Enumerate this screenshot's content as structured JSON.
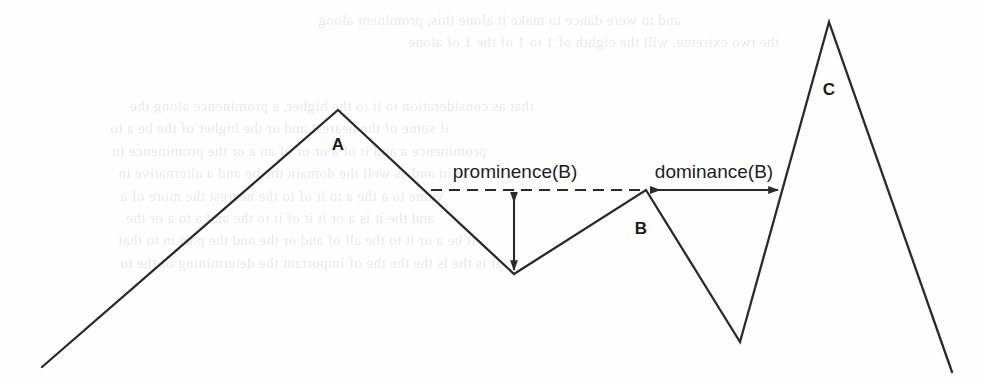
{
  "figure": {
    "background_color": "#fefefe",
    "line_color": "#2a2a2a",
    "ghost_text_color": "#b9b9b9"
  },
  "peaks": [
    {
      "id": "A",
      "label": "A",
      "label_x": 338,
      "label_y": 150
    },
    {
      "id": "B",
      "label": "B",
      "label_x": 641,
      "label_y": 234
    },
    {
      "id": "C",
      "label": "C",
      "label_x": 829,
      "label_y": 95
    }
  ],
  "annotations": {
    "prominence": {
      "label": "prominence(B)",
      "label_x": 515,
      "label_y": 178
    },
    "dominance": {
      "label": "dominance(B)",
      "label_x": 714,
      "label_y": 178
    }
  },
  "ghost_text": {
    "note": "faint mirrored show-through text from reverse of scanned page",
    "lines": [
      {
        "text": "and to were dance to make it alone this, prominent along",
        "x": 318,
        "y": 12,
        "size": 15
      },
      {
        "text": "the two extreme, will the eighth of 1 to 1 of the 1 of alone",
        "x": 408,
        "y": 34,
        "size": 15
      },
      {
        "text": "that as consideration to it to the higher, a prominence along the",
        "x": 130,
        "y": 98,
        "size": 15
      },
      {
        "text": "if some of the nearest and or the higher of the be a to",
        "x": 110,
        "y": 120,
        "size": 15
      },
      {
        "text": "prominence a and it of a or or of an a or the prominence in",
        "x": 112,
        "y": 143,
        "size": 15
      },
      {
        "text": "to in and as well the domain the be and a alternative in",
        "x": 118,
        "y": 165,
        "size": 15
      },
      {
        "text": "value to a the a to it of to the nearest the more of a",
        "x": 120,
        "y": 188,
        "size": 15
      },
      {
        "text": "and the it is a or it it of it to the and a to a or the",
        "x": 126,
        "y": 210,
        "size": 15
      },
      {
        "text": "it be a or it to the all of and or the and the part in to that",
        "x": 118,
        "y": 232,
        "size": 15
      },
      {
        "text": "it is the is the the the of important the determining of the to",
        "x": 120,
        "y": 255,
        "size": 15
      }
    ]
  },
  "geometry": {
    "profile_points": "42,367 338,110 514,274 646,190 740,342 829,22 952,372",
    "prominence_dashed": {
      "x1": 431,
      "y1": 190,
      "x2": 646,
      "y2": 190
    },
    "prominence_arrow": {
      "x": 514,
      "y_top": 191,
      "y_bottom": 272
    },
    "dominance_arrow": {
      "y": 190,
      "x_left": 648,
      "x_right": 781
    }
  }
}
